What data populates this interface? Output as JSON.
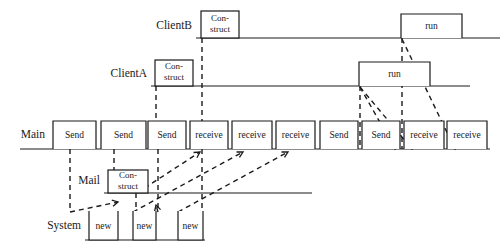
{
  "diagram": {
    "type": "sequence-diagram",
    "background_color": "#ffffff",
    "line_color": "#1a1a1a",
    "lanes": [
      {
        "id": "clientb",
        "label": "ClientB",
        "label_x": 196,
        "label_y": 26,
        "line_y": 38,
        "line_x1": 196,
        "line_x2": 500
      },
      {
        "id": "clienta",
        "label": "ClientA",
        "label_x": 151,
        "label_y": 74,
        "line_y": 86,
        "line_x1": 151,
        "line_x2": 470
      },
      {
        "id": "main",
        "label": "Main",
        "label_x": 49,
        "label_y": 135,
        "line_y": 149,
        "line_x1": 20,
        "line_x2": 490
      },
      {
        "id": "mail",
        "label": "Mail",
        "label_x": 104,
        "label_y": 181,
        "line_y": 193,
        "line_x1": 104,
        "line_x2": 312
      },
      {
        "id": "system",
        "label": "System",
        "label_x": 85,
        "label_y": 226,
        "line_y": 240,
        "line_x1": 85,
        "line_x2": 205
      }
    ],
    "activations": [
      {
        "lane": "clientb",
        "label": "Con-struct",
        "line1": "Con-",
        "line2": "struct",
        "x": 201,
        "y": 11,
        "w": 38,
        "h": 27,
        "style": "closed"
      },
      {
        "lane": "clientb",
        "label": "run",
        "line1": "run",
        "line2": "",
        "x": 401,
        "y": 14,
        "w": 61,
        "h": 24,
        "style": "open-bottom"
      },
      {
        "lane": "clienta",
        "label": "Con-struct",
        "line1": "Con-",
        "line2": "struct",
        "x": 155,
        "y": 60,
        "w": 38,
        "h": 26,
        "style": "closed"
      },
      {
        "lane": "clienta",
        "label": "run",
        "line1": "run",
        "line2": "",
        "x": 359,
        "y": 62,
        "w": 71,
        "h": 24,
        "style": "open-bottom"
      },
      {
        "lane": "main",
        "label": "Send",
        "line1": "Send",
        "line2": "",
        "x": 53,
        "y": 121,
        "w": 43,
        "h": 28,
        "style": "open-bottom"
      },
      {
        "lane": "main",
        "label": "Send",
        "line1": "Send",
        "line2": "",
        "x": 101,
        "y": 121,
        "w": 45,
        "h": 28,
        "style": "open-bottom"
      },
      {
        "lane": "main",
        "label": "Send",
        "line1": "Send",
        "line2": "",
        "x": 148,
        "y": 121,
        "w": 38,
        "h": 28,
        "style": "open-bottom"
      },
      {
        "lane": "main",
        "label": "receive",
        "line1": "receive",
        "line2": "",
        "x": 190,
        "y": 121,
        "w": 38,
        "h": 28,
        "style": "open-bottom"
      },
      {
        "lane": "main",
        "label": "receive",
        "line1": "receive",
        "line2": "",
        "x": 232,
        "y": 121,
        "w": 40,
        "h": 28,
        "style": "open-bottom"
      },
      {
        "lane": "main",
        "label": "receive",
        "line1": "receive",
        "line2": "",
        "x": 276,
        "y": 121,
        "w": 39,
        "h": 28,
        "style": "open-bottom"
      },
      {
        "lane": "main",
        "label": "Send",
        "line1": "Send",
        "line2": "",
        "x": 320,
        "y": 121,
        "w": 38,
        "h": 28,
        "style": "open-bottom"
      },
      {
        "lane": "main",
        "label": "Send",
        "line1": "Send",
        "line2": "",
        "x": 362,
        "y": 121,
        "w": 38,
        "h": 28,
        "style": "open-bottom"
      },
      {
        "lane": "main",
        "label": "receive",
        "line1": "receive",
        "line2": "",
        "x": 404,
        "y": 121,
        "w": 40,
        "h": 28,
        "style": "open-bottom"
      },
      {
        "lane": "main",
        "label": "receive",
        "line1": "receive",
        "line2": "",
        "x": 447,
        "y": 121,
        "w": 40,
        "h": 28,
        "style": "open-bottom"
      },
      {
        "lane": "mail",
        "label": "Con-struct",
        "line1": "Con-",
        "line2": "struct",
        "x": 108,
        "y": 170,
        "w": 40,
        "h": 23,
        "style": "closed"
      },
      {
        "lane": "system",
        "label": "new",
        "line1": "new",
        "line2": "",
        "x": 89,
        "y": 211,
        "w": 29,
        "h": 29,
        "style": "open-top"
      },
      {
        "lane": "system",
        "label": "new",
        "line1": "new",
        "line2": "",
        "x": 133,
        "y": 211,
        "w": 23,
        "h": 29,
        "style": "open-top"
      },
      {
        "lane": "system",
        "label": "new",
        "line1": "new",
        "line2": "",
        "x": 178,
        "y": 211,
        "w": 25,
        "h": 29,
        "style": "open-top"
      }
    ],
    "vertical_lifelines": [
      {
        "from": "clientb-construct",
        "x": 202,
        "y1": 38,
        "y2": 122
      },
      {
        "from": "clienta-construct",
        "x": 156,
        "y1": 86,
        "y2": 122
      },
      {
        "from": "main-send1",
        "x": 70,
        "y1": 149,
        "y2": 212
      },
      {
        "from": "main-send2",
        "x": 114,
        "y1": 149,
        "y2": 171
      },
      {
        "from": "main-send3",
        "x": 158,
        "y1": 149,
        "y2": 212
      },
      {
        "from": "main-receive1",
        "x": 202,
        "y1": 149,
        "y2": 212
      },
      {
        "from": "clienta-run",
        "x": 360,
        "y1": 86,
        "y2": 149
      },
      {
        "from": "clientb-run",
        "x": 402,
        "y1": 38,
        "y2": 149
      },
      {
        "from": "mail-construct",
        "x": 136,
        "y1": 193,
        "y2": 212
      }
    ],
    "messages": [
      {
        "id": "m1",
        "from": "main-send1",
        "to": "system-new1",
        "x1": 70,
        "y1": 212,
        "x2": 118,
        "y2": 202,
        "kind": "dashed"
      },
      {
        "id": "m2",
        "from": "mail-construct",
        "to": "main-receive",
        "x1": 137,
        "y1": 193,
        "x2": 200,
        "y2": 152,
        "kind": "dashed"
      },
      {
        "id": "m3",
        "from": "main-send3",
        "to": "system-new2",
        "x1": 158,
        "y1": 212,
        "x2": 156,
        "y2": 205,
        "kind": "dashed"
      },
      {
        "id": "m4",
        "from": "system-new2",
        "to": "main-receive2",
        "x1": 133,
        "y1": 212,
        "x2": 243,
        "y2": 152,
        "kind": "dashed"
      },
      {
        "id": "m5",
        "from": "system-new3",
        "to": "main-receive3",
        "x1": 178,
        "y1": 212,
        "x2": 288,
        "y2": 152,
        "kind": "dashed"
      },
      {
        "id": "m6",
        "from": "clienta-run",
        "to": "main-receive-r1",
        "x1": 360,
        "y1": 87,
        "x2": 412,
        "y2": 149,
        "kind": "dashed"
      },
      {
        "id": "m7",
        "from": "clientb-run",
        "to": "main-receive-r2",
        "x1": 402,
        "y1": 39,
        "x2": 455,
        "y2": 149,
        "kind": "dashed"
      },
      {
        "id": "m8",
        "from": "clienta-run",
        "to": "lower-left",
        "x1": 360,
        "y1": 87,
        "x2": 395,
        "y2": 149,
        "kind": "dashed"
      }
    ]
  }
}
